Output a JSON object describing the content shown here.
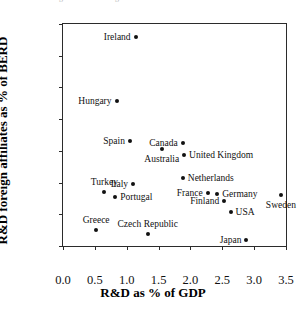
{
  "figure": {
    "top_clipped_caption": "Figure: R&D foreign affiliates as % of BERD versus R&D as % of GDP"
  },
  "chart_data": {
    "type": "scatter",
    "title": "",
    "xlabel": "R&D as % of GDP",
    "ylabel": "R&D foreign affiliates as % of BERD",
    "xlim": [
      0.0,
      3.5
    ],
    "ylim": [
      0,
      70
    ],
    "xticks": [
      "0.0",
      "0.5",
      "1.0",
      "1.5",
      "2.0",
      "2.5",
      "3.0",
      "3.5"
    ],
    "xtick_values": [
      0.0,
      0.5,
      1.0,
      1.5,
      2.0,
      2.5,
      3.0,
      3.5
    ],
    "yticks": [
      "0",
      "10",
      "20",
      "30",
      "40",
      "50",
      "60",
      "70"
    ],
    "ytick_values": [
      0,
      10,
      20,
      30,
      40,
      50,
      60,
      70
    ],
    "grid": false,
    "legend": false,
    "marker_color": "#111111",
    "points": [
      {
        "label": "Ireland",
        "x": 1.14,
        "y": 66.0,
        "label_pos": "left"
      },
      {
        "label": "Hungary",
        "x": 0.84,
        "y": 45.8,
        "label_pos": "left"
      },
      {
        "label": "Spain",
        "x": 1.05,
        "y": 33.0,
        "label_pos": "left"
      },
      {
        "label": "Canada",
        "x": 1.88,
        "y": 32.4,
        "label_pos": "left"
      },
      {
        "label": "Australia",
        "x": 1.55,
        "y": 30.6,
        "label_pos": "below"
      },
      {
        "label": "United Kingdom",
        "x": 1.9,
        "y": 28.6,
        "label_pos": "right"
      },
      {
        "label": "Netherlands",
        "x": 1.88,
        "y": 21.4,
        "label_pos": "right"
      },
      {
        "label": "Italy",
        "x": 1.1,
        "y": 19.6,
        "label_pos": "left"
      },
      {
        "label": "Turkey",
        "x": 0.65,
        "y": 17.0,
        "label_pos": "above"
      },
      {
        "label": "France",
        "x": 2.27,
        "y": 16.6,
        "label_pos": "left"
      },
      {
        "label": "Germany",
        "x": 2.42,
        "y": 16.4,
        "label_pos": "right"
      },
      {
        "label": "Sweden",
        "x": 3.42,
        "y": 16.2,
        "label_pos": "below"
      },
      {
        "label": "Portugal",
        "x": 0.82,
        "y": 15.6,
        "label_pos": "right"
      },
      {
        "label": "Finland",
        "x": 2.53,
        "y": 14.2,
        "label_pos": "left"
      },
      {
        "label": "USA",
        "x": 2.63,
        "y": 10.6,
        "label_pos": "right"
      },
      {
        "label": "Greece",
        "x": 0.52,
        "y": 5.0,
        "label_pos": "above"
      },
      {
        "label": "Czech Republic",
        "x": 1.33,
        "y": 3.8,
        "label_pos": "above"
      },
      {
        "label": "Japan",
        "x": 2.88,
        "y": 1.8,
        "label_pos": "left"
      }
    ]
  }
}
